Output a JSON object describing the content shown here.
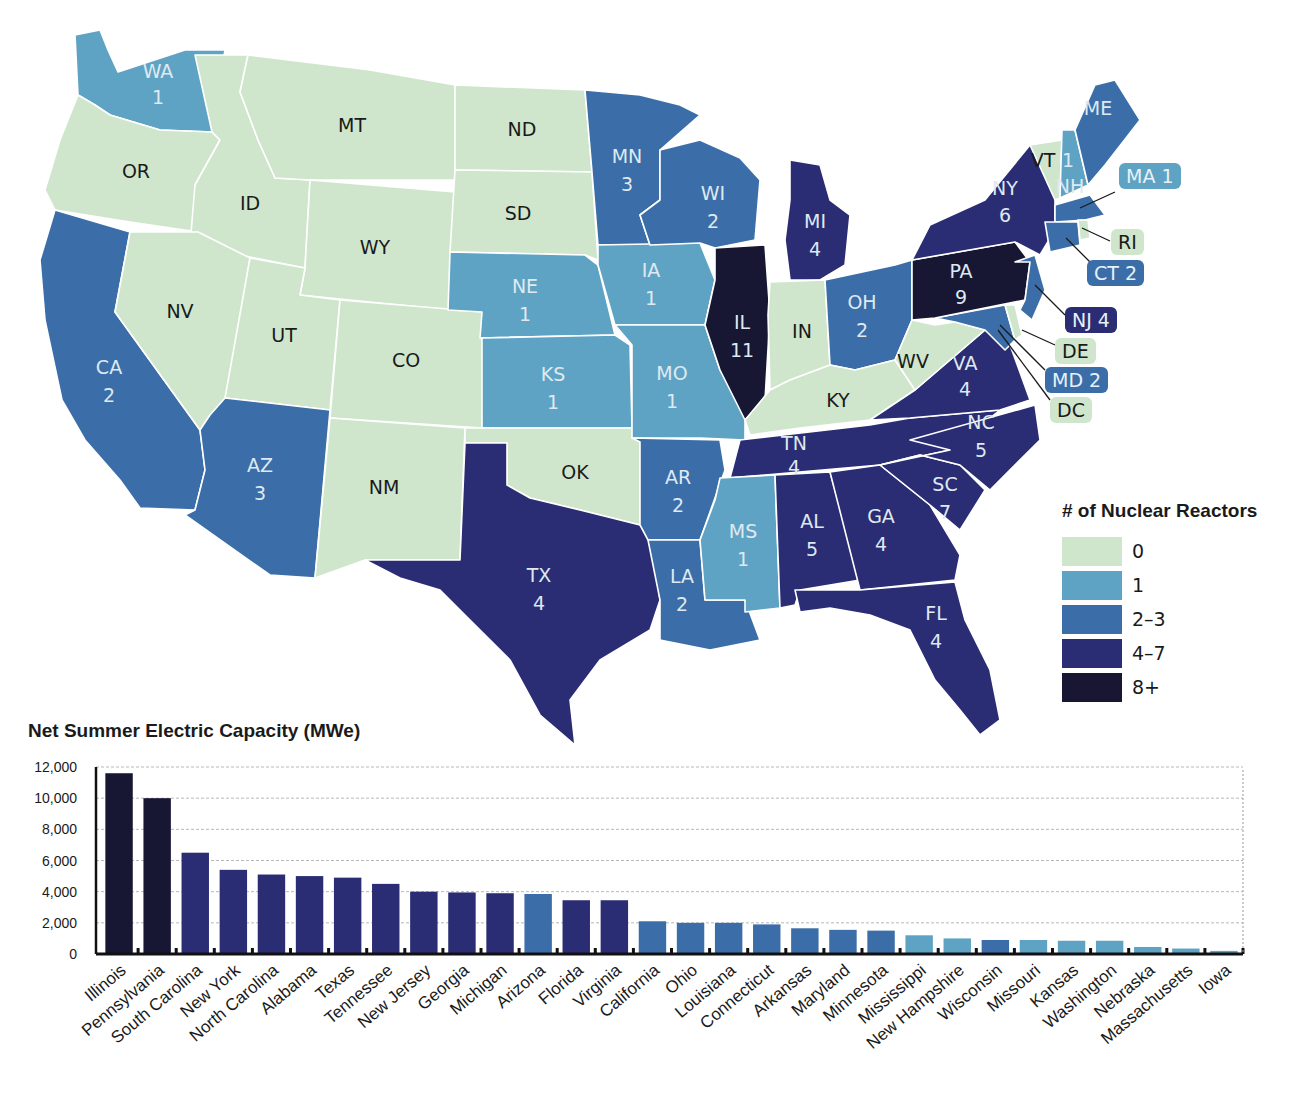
{
  "map": {
    "legend": {
      "title": "# of Nuclear Reactors",
      "items": [
        {
          "label": "0",
          "color": "#cfe6cd"
        },
        {
          "label": "1",
          "color": "#5fa3c4"
        },
        {
          "label": "2–3",
          "color": "#3b6ea8"
        },
        {
          "label": "4–7",
          "color": "#2a2d74"
        },
        {
          "label": "8+",
          "color": "#171733"
        }
      ]
    },
    "states": [
      {
        "abbr": "WA",
        "reactors": 1
      },
      {
        "abbr": "OR",
        "reactors": 0
      },
      {
        "abbr": "CA",
        "reactors": 2
      },
      {
        "abbr": "ID",
        "reactors": 0
      },
      {
        "abbr": "NV",
        "reactors": 0
      },
      {
        "abbr": "MT",
        "reactors": 0
      },
      {
        "abbr": "WY",
        "reactors": 0
      },
      {
        "abbr": "UT",
        "reactors": 0
      },
      {
        "abbr": "AZ",
        "reactors": 3
      },
      {
        "abbr": "CO",
        "reactors": 0
      },
      {
        "abbr": "NM",
        "reactors": 0
      },
      {
        "abbr": "ND",
        "reactors": 0
      },
      {
        "abbr": "SD",
        "reactors": 0
      },
      {
        "abbr": "NE",
        "reactors": 1
      },
      {
        "abbr": "KS",
        "reactors": 1
      },
      {
        "abbr": "OK",
        "reactors": 0
      },
      {
        "abbr": "TX",
        "reactors": 4
      },
      {
        "abbr": "MN",
        "reactors": 3
      },
      {
        "abbr": "IA",
        "reactors": 1
      },
      {
        "abbr": "MO",
        "reactors": 1
      },
      {
        "abbr": "AR",
        "reactors": 2
      },
      {
        "abbr": "LA",
        "reactors": 2
      },
      {
        "abbr": "WI",
        "reactors": 2
      },
      {
        "abbr": "IL",
        "reactors": 11
      },
      {
        "abbr": "MI",
        "reactors": 4
      },
      {
        "abbr": "IN",
        "reactors": 0
      },
      {
        "abbr": "OH",
        "reactors": 2
      },
      {
        "abbr": "KY",
        "reactors": 0
      },
      {
        "abbr": "TN",
        "reactors": 4
      },
      {
        "abbr": "MS",
        "reactors": 1
      },
      {
        "abbr": "AL",
        "reactors": 5
      },
      {
        "abbr": "GA",
        "reactors": 4
      },
      {
        "abbr": "FL",
        "reactors": 4
      },
      {
        "abbr": "SC",
        "reactors": 7
      },
      {
        "abbr": "NC",
        "reactors": 5
      },
      {
        "abbr": "VA",
        "reactors": 4
      },
      {
        "abbr": "WV",
        "reactors": 0
      },
      {
        "abbr": "PA",
        "reactors": 9
      },
      {
        "abbr": "NY",
        "reactors": 6
      },
      {
        "abbr": "VT",
        "reactors": 0
      },
      {
        "abbr": "NH",
        "reactors": 1
      },
      {
        "abbr": "ME",
        "reactors": 0
      },
      {
        "abbr": "MA",
        "reactors": 1
      },
      {
        "abbr": "RI",
        "reactors": 0
      },
      {
        "abbr": "CT",
        "reactors": 2
      },
      {
        "abbr": "NJ",
        "reactors": 4
      },
      {
        "abbr": "DE",
        "reactors": 0
      },
      {
        "abbr": "MD",
        "reactors": 2
      },
      {
        "abbr": "DC",
        "reactors": 0
      }
    ],
    "labels": {
      "WA": "WA",
      "WA_n": "1",
      "OR": "OR",
      "CA": "CA",
      "CA_n": "2",
      "ID": "ID",
      "NV": "NV",
      "MT": "MT",
      "WY": "WY",
      "UT": "UT",
      "AZ": "AZ",
      "AZ_n": "3",
      "CO": "CO",
      "NM": "NM",
      "ND": "ND",
      "SD": "SD",
      "NE": "NE",
      "NE_n": "1",
      "KS": "KS",
      "KS_n": "1",
      "OK": "OK",
      "TX": "TX",
      "TX_n": "4",
      "MN": "MN",
      "MN_n": "3",
      "IA": "IA",
      "IA_n": "1",
      "MO": "MO",
      "MO_n": "1",
      "AR": "AR",
      "AR_n": "2",
      "LA": "LA",
      "LA_n": "2",
      "WI": "WI",
      "WI_n": "2",
      "IL": "IL",
      "IL_n": "11",
      "MI": "MI",
      "MI_n": "4",
      "IN": "IN",
      "OH": "OH",
      "OH_n": "2",
      "KY": "KY",
      "TN": "TN",
      "TN_n": "4",
      "MS": "MS",
      "MS_n": "1",
      "AL": "AL",
      "AL_n": "5",
      "GA": "GA",
      "GA_n": "4",
      "FL": "FL",
      "FL_n": "4",
      "SC": "SC",
      "SC_n": "7",
      "NC": "NC",
      "NC_n": "5",
      "VA": "VA",
      "VA_n": "4",
      "WV": "WV",
      "PA": "PA",
      "PA_n": "9",
      "NY": "NY",
      "NY_n": "6",
      "VT": "VT",
      "NH": "NH",
      "NH_n": "1",
      "ME": "ME"
    },
    "callouts": {
      "MA": "MA 1",
      "RI": "RI",
      "CT": "CT 2",
      "NJ": "NJ 4",
      "DE": "DE",
      "MD": "MD 2",
      "DC": "DC"
    }
  },
  "chart_data": {
    "type": "bar",
    "title": "Net Summer Electric Capacity (MWe)",
    "xlabel": "",
    "ylabel": "Net Summer Electric Capacity (MWe)",
    "ylim": [
      0,
      12000
    ],
    "yticks": [
      "0",
      "2,000",
      "4,000",
      "6,000",
      "8,000",
      "10,000",
      "12,000"
    ],
    "grid": true,
    "categories": [
      "Illinois",
      "Pennsylvania",
      "South Carolina",
      "New York",
      "North Carolina",
      "Alabama",
      "Texas",
      "Tennessee",
      "New Jersey",
      "Georgia",
      "Michigan",
      "Arizona",
      "Florida",
      "Virginia",
      "California",
      "Ohio",
      "Louisiana",
      "Connecticut",
      "Arkansas",
      "Maryland",
      "Minnesota",
      "Mississippi",
      "New Hampshire",
      "Wisconsin",
      "Missouri",
      "Kansas",
      "Washington",
      "Nebraska",
      "Massachusetts",
      "Iowa"
    ],
    "values": [
      11600,
      10000,
      6500,
      5400,
      5100,
      5000,
      4900,
      4500,
      4000,
      3950,
      3900,
      3850,
      3450,
      3450,
      2100,
      2000,
      2000,
      1900,
      1650,
      1550,
      1500,
      1200,
      1000,
      900,
      900,
      850,
      850,
      450,
      350,
      200
    ],
    "bar_colors": [
      "#171733",
      "#171733",
      "#2a2d74",
      "#2a2d74",
      "#2a2d74",
      "#2a2d74",
      "#2a2d74",
      "#2a2d74",
      "#2a2d74",
      "#2a2d74",
      "#2a2d74",
      "#3b6ea8",
      "#2a2d74",
      "#2a2d74",
      "#3b6ea8",
      "#3b6ea8",
      "#3b6ea8",
      "#3b6ea8",
      "#3b6ea8",
      "#3b6ea8",
      "#3b6ea8",
      "#5fa3c4",
      "#5fa3c4",
      "#3b6ea8",
      "#5fa3c4",
      "#5fa3c4",
      "#5fa3c4",
      "#5fa3c4",
      "#5fa3c4",
      "#5fa3c4"
    ]
  }
}
